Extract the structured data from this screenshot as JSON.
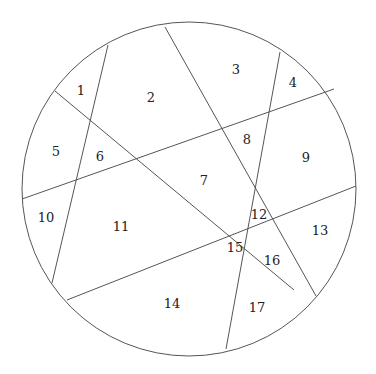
{
  "diagram": {
    "type": "circle-partition",
    "stroke_color": "#555555",
    "background": "#ffffff",
    "circle": {
      "cx": 189,
      "cy": 189,
      "r": 167
    },
    "chords": [
      {
        "id": "A",
        "x1": 108,
        "y1": 45,
        "x2": 52,
        "y2": 283
      },
      {
        "id": "B",
        "x1": 165,
        "y1": 27,
        "x2": 316,
        "y2": 296
      },
      {
        "id": "C",
        "x1": 280,
        "y1": 52,
        "x2": 226,
        "y2": 349
      },
      {
        "id": "D",
        "x1": 55,
        "y1": 91,
        "x2": 294,
        "y2": 290
      },
      {
        "id": "E",
        "x1": 22,
        "y1": 199,
        "x2": 334,
        "y2": 89
      },
      {
        "id": "F",
        "x1": 67,
        "y1": 300,
        "x2": 356,
        "y2": 186
      }
    ],
    "regions": [
      {
        "label": "1",
        "x": 81,
        "y": 90
      },
      {
        "label": "2",
        "x": 151,
        "y": 97
      },
      {
        "label": "3",
        "x": 236,
        "y": 69
      },
      {
        "label": "4",
        "x": 293,
        "y": 82
      },
      {
        "label": "5",
        "x": 56,
        "y": 151
      },
      {
        "label": "6",
        "x": 100,
        "y": 156
      },
      {
        "label": "7",
        "x": 204,
        "y": 180
      },
      {
        "label": "8",
        "x": 247,
        "y": 139
      },
      {
        "label": "9",
        "x": 306,
        "y": 157
      },
      {
        "label": "10",
        "x": 46,
        "y": 217
      },
      {
        "label": "11",
        "x": 121,
        "y": 226
      },
      {
        "label": "12",
        "x": 259,
        "y": 214
      },
      {
        "label": "13",
        "x": 320,
        "y": 230
      },
      {
        "label": "14",
        "x": 172,
        "y": 303
      },
      {
        "label": "15",
        "x": 235,
        "y": 247
      },
      {
        "label": "16",
        "x": 272,
        "y": 260
      },
      {
        "label": "17",
        "x": 257,
        "y": 307
      }
    ]
  }
}
